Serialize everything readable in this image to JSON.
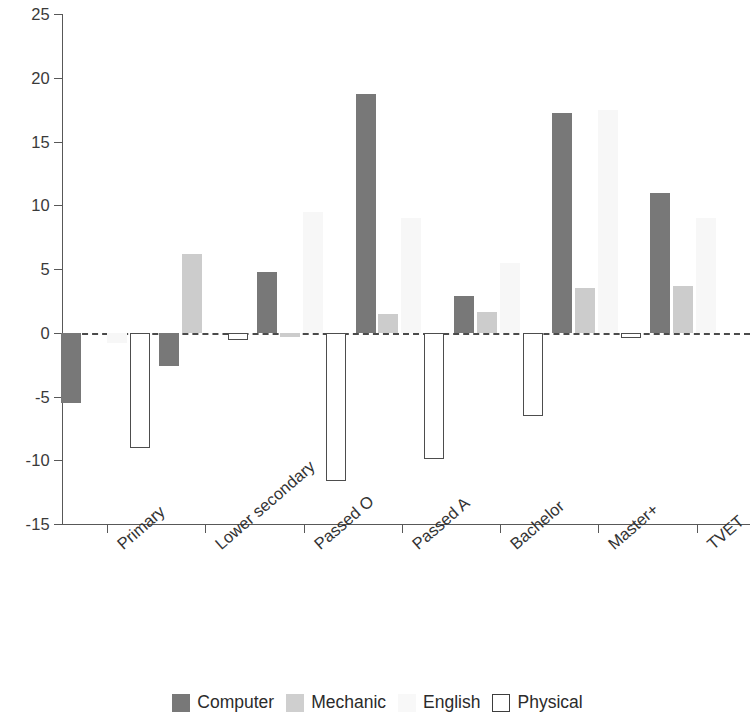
{
  "chart_data": {
    "type": "bar",
    "title": "",
    "subtitle": "",
    "xlabel": "",
    "ylabel": "",
    "grid": false,
    "legend_position": "bottom",
    "orientation": "vertical",
    "grouping": "grouped",
    "ylim": [
      -15,
      25
    ],
    "ytick_labels": [
      "25",
      "20",
      "15",
      "10",
      "5",
      "0",
      "-5",
      "-10",
      "-15"
    ],
    "ytick_values": [
      25,
      20,
      15,
      10,
      5,
      0,
      -5,
      -10,
      -15
    ],
    "categories": [
      "Primary",
      "Lower secondary",
      "Passed O",
      "Passed A",
      "Bachelor",
      "Master+",
      "TVET"
    ],
    "series": [
      {
        "name": "Computer",
        "color": "#787878",
        "values": [
          -5.5,
          -2.6,
          4.8,
          18.7,
          2.9,
          17.2,
          11.0
        ]
      },
      {
        "name": "Mechanic",
        "color": "#cccccc",
        "values": [
          0.0,
          6.2,
          -0.3,
          1.5,
          1.6,
          3.5,
          3.7
        ]
      },
      {
        "name": "English",
        "color": "#f7f7f7",
        "values": [
          -0.8,
          0.0,
          9.5,
          9.0,
          5.5,
          17.5,
          9.0
        ]
      },
      {
        "name": "Physical",
        "color": "#ffffff",
        "values": [
          -9.0,
          -0.6,
          -11.6,
          -9.9,
          -6.5,
          -0.4,
          0.0
        ]
      }
    ],
    "zero_line": 0,
    "zero_line_style": "dashed"
  },
  "legend": {
    "items": [
      {
        "label": "Computer",
        "swatch": "computer"
      },
      {
        "label": "Mechanic",
        "swatch": "mechanic"
      },
      {
        "label": "English",
        "swatch": "english"
      },
      {
        "label": "Physical",
        "swatch": "physical"
      }
    ]
  }
}
